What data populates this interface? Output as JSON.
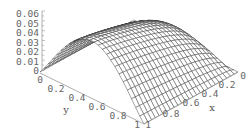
{
  "chart_data": {
    "type": "surface3d",
    "title": "",
    "xlabel": "x",
    "ylabel": "y",
    "zlabel": "",
    "xlim": [
      0,
      1
    ],
    "ylim": [
      0,
      1
    ],
    "zlim": [
      0,
      0.06
    ],
    "x_ticks": [
      "0",
      "0.2",
      "0.4",
      "0.6",
      "0.8",
      "1"
    ],
    "y_ticks": [
      "0",
      "0.2",
      "0.4",
      "0.6",
      "0.8",
      "1"
    ],
    "z_ticks": [
      "0",
      "0.01",
      "0.02",
      "0.03",
      "0.04",
      "0.05",
      "0.06"
    ],
    "grid_resolution": 25,
    "peak_value": 0.06,
    "mesh_color": "#333333",
    "background": "#ffffff"
  },
  "labels": {
    "z_ticks": [
      "0.06",
      "0.05",
      "0.04",
      "0.03",
      "0.02",
      "0.01"
    ],
    "z_zero": "0",
    "y_ticks": [
      "0",
      "0.2",
      "0.4",
      "0.6",
      "0.8",
      "1"
    ],
    "x_ticks": [
      "1",
      "0.8",
      "0.6",
      "0.4",
      "0.2",
      "0"
    ],
    "x_title": "x",
    "y_title": "y"
  }
}
